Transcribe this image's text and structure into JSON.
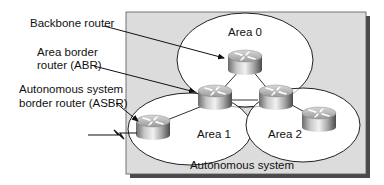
{
  "diagram": {
    "type": "OSPF network topology",
    "container": {
      "label": "Autonomous system",
      "fill": "#dcdcdc",
      "shadow": "#555555"
    },
    "areas": [
      {
        "id": "area0",
        "label": "Area 0"
      },
      {
        "id": "area1",
        "label": "Area 1"
      },
      {
        "id": "area2",
        "label": "Area 2"
      }
    ],
    "callouts": [
      {
        "id": "backbone",
        "lines": [
          "Backbone router"
        ]
      },
      {
        "id": "abr",
        "lines": [
          "Area border",
          "router (ABR)"
        ]
      },
      {
        "id": "asbr",
        "lines": [
          "Autonomous system",
          "border router (ASBR)"
        ]
      }
    ],
    "routers": [
      {
        "id": "r-backbone",
        "area": "Area 0"
      },
      {
        "id": "r-abr",
        "area": "Area 0 / Area 1"
      },
      {
        "id": "r-abr2",
        "area": "Area 0 / Area 2"
      },
      {
        "id": "r-asbr",
        "area": "Area 1"
      },
      {
        "id": "r-area2",
        "area": "Area 2"
      }
    ],
    "external_link": "serial-link (lightning bolt)"
  }
}
